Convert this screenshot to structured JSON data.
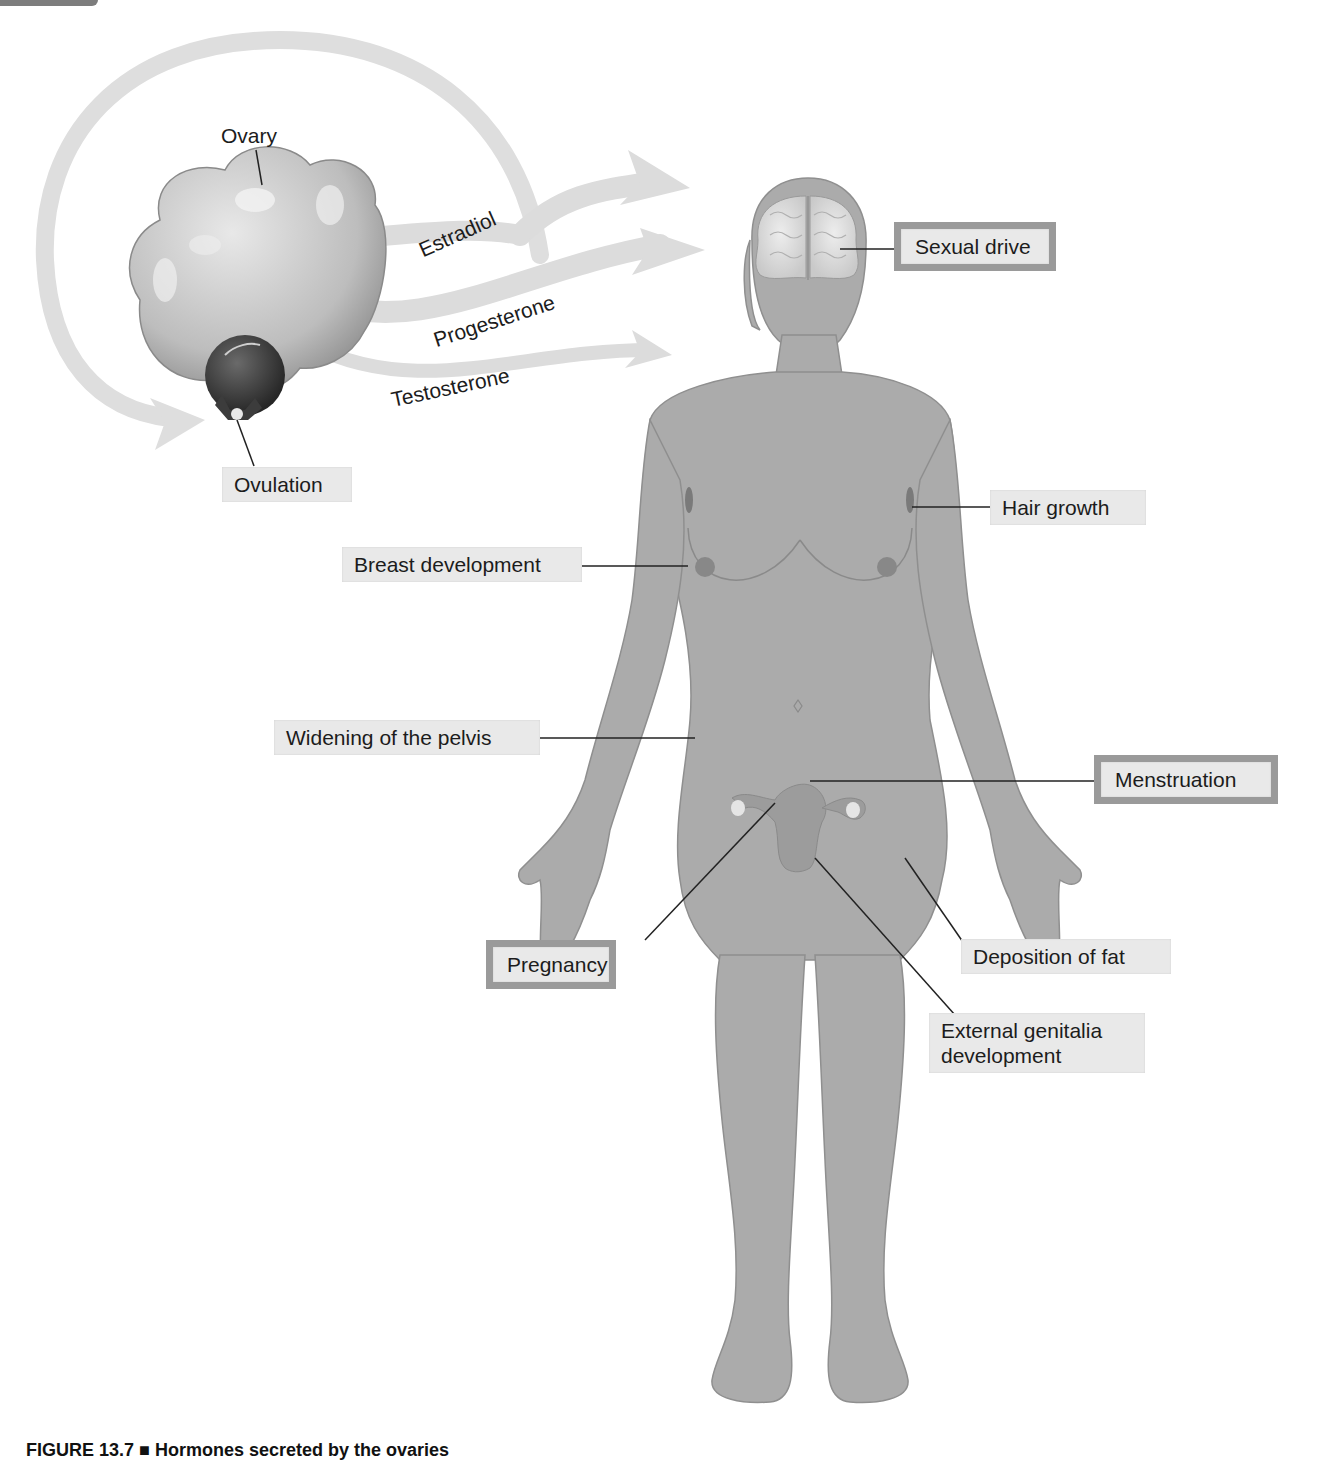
{
  "figure": {
    "caption": "FIGURE 13.7 ■ Hormones secreted by the ovaries",
    "background_color": "#ffffff",
    "body_color": "#a9a9a9",
    "arrow_color": "#e0e0e0",
    "label_fill": "#e9e9e9",
    "highlight_border": "#9a9a9a"
  },
  "ovary": {
    "label": "Ovary",
    "ovulation_label": "Ovulation"
  },
  "hormones": [
    {
      "name": "Estradiol"
    },
    {
      "name": "Progesterone"
    },
    {
      "name": "Testosterone"
    }
  ],
  "effects": [
    {
      "label": "Sexual drive",
      "highlighted": true
    },
    {
      "label": "Hair growth",
      "highlighted": false
    },
    {
      "label": "Breast development",
      "highlighted": false
    },
    {
      "label": "Widening of the pelvis",
      "highlighted": false
    },
    {
      "label": "Menstruation",
      "highlighted": true
    },
    {
      "label": "Pregnancy",
      "highlighted": true
    },
    {
      "label": "Deposition of fat",
      "highlighted": false
    },
    {
      "label": "External genitalia development",
      "highlighted": false
    }
  ]
}
